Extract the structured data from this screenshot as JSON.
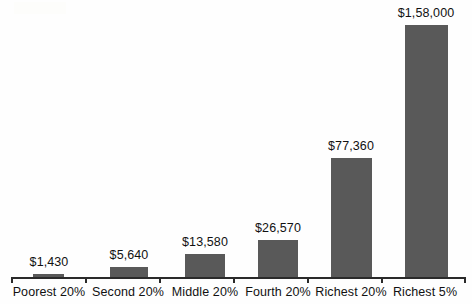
{
  "chart_data": {
    "type": "bar",
    "title": "",
    "subtitle": "",
    "xlabel": "",
    "ylabel": "",
    "grid": false,
    "legend": "none",
    "axis": {
      "x_line": true,
      "x_ticks_at_category_boundaries": true,
      "y_axis_visible": false,
      "ylim": [
        0,
        158000
      ]
    },
    "categories": [
      "Poorest 20%",
      "Second 20%",
      "Middle 20%",
      "Fourth 20%",
      "Richest 20%",
      "Richest 5%"
    ],
    "values": [
      1430,
      5640,
      13580,
      26570,
      77360,
      158000
    ],
    "value_labels": [
      "$1,430",
      "$5,640",
      "$13,580",
      "$26,570",
      "$77,360",
      "$1,58,000"
    ],
    "bar_color": "#595959",
    "text_color": "#111111",
    "background_color": "#fefefe"
  },
  "bars": [
    {
      "label": "Poorest 20%",
      "value_label": "$1,430",
      "left": 33,
      "width": 31,
      "top": 274,
      "height": 3,
      "label_left": 9,
      "label_width": 80,
      "label_top": 255,
      "cat_left": 0,
      "cat_width": 98
    },
    {
      "label": "Second 20%",
      "value_label": "$5,640",
      "left": 110,
      "width": 38,
      "top": 267,
      "height": 10,
      "label_left": 89,
      "label_width": 80,
      "label_top": 248,
      "cat_left": 79,
      "cat_width": 98
    },
    {
      "label": "Middle 20%",
      "value_label": "$13,580",
      "left": 185,
      "width": 40,
      "top": 254,
      "height": 23,
      "label_left": 164,
      "label_width": 82,
      "label_top": 235,
      "cat_left": 156,
      "cat_width": 98
    },
    {
      "label": "Fourth 20%",
      "value_label": "$26,570",
      "left": 258,
      "width": 40,
      "top": 240,
      "height": 37,
      "label_left": 237,
      "label_width": 82,
      "label_top": 221,
      "cat_left": 229,
      "cat_width": 98
    },
    {
      "label": "Richest 20%",
      "value_label": "$77,360",
      "left": 331,
      "width": 41,
      "top": 158,
      "height": 119,
      "label_left": 310,
      "label_width": 82,
      "label_top": 139,
      "cat_left": 302,
      "cat_width": 98
    },
    {
      "label": "Richest 5%",
      "value_label": "$1,58,000",
      "left": 405,
      "width": 43,
      "top": 25,
      "height": 252,
      "label_left": 380,
      "label_width": 92,
      "label_top": 6,
      "cat_left": 378,
      "cat_width": 94
    }
  ],
  "ticks": [
    11,
    85,
    159,
    233,
    307,
    381,
    464
  ]
}
